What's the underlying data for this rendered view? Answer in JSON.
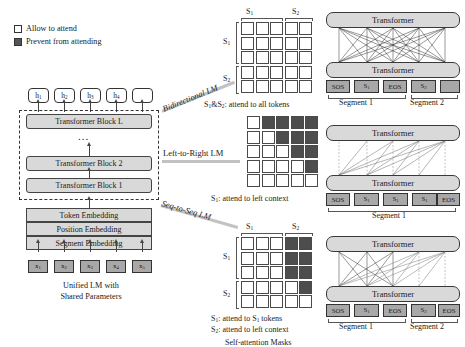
{
  "figure": {
    "kind": "unilm-pretraining-diagram",
    "legend": {
      "allow_label": "Allow to attend",
      "prevent_label": "Prevent from attending",
      "allow_color": "#ffffff",
      "prevent_color": "#4d4d4d"
    },
    "left_panel": {
      "hidden_states": [
        "h1",
        "h2",
        "h3",
        "h4",
        ""
      ],
      "blocks": [
        "Transformer Block L",
        "Transformer Block 2",
        "Transformer Block 1"
      ],
      "ellipsis": "...",
      "embeddings": [
        "Token Embedding",
        "Position Embedding",
        "Segment Embedding"
      ],
      "input_tokens": [
        "x1",
        "x2",
        "x3",
        "x4",
        "x5"
      ],
      "caption_line1": "Unified LM with",
      "caption_line2": "Shared Parameters"
    },
    "objectives": [
      {
        "name": "bidirectional",
        "label": "Bidirectional LM"
      },
      {
        "name": "left-to-right",
        "label": "Left-to-Right LM"
      },
      {
        "name": "seq-to-seq",
        "label": "Seq-to-Seq LM"
      }
    ],
    "masks": [
      {
        "name": "bidirectional-mask",
        "col_labels": [
          "S1",
          "S2"
        ],
        "row_labels": [
          "S1",
          "S2"
        ],
        "rows": [
          [
            "w",
            "w",
            "w",
            "w",
            "w"
          ],
          [
            "w",
            "w",
            "w",
            "w",
            "w"
          ],
          [
            "w",
            "w",
            "w",
            "w",
            "w"
          ],
          [
            "w",
            "w",
            "w",
            "w",
            "w"
          ],
          [
            "w",
            "w",
            "w",
            "w",
            "w"
          ]
        ],
        "captions": [
          "S1&S2: attend to all tokens"
        ]
      },
      {
        "name": "left-to-right-mask",
        "col_labels": [],
        "row_labels": [],
        "rows": [
          [
            "w",
            "d",
            "d",
            "d",
            "d"
          ],
          [
            "w",
            "w",
            "d",
            "d",
            "d"
          ],
          [
            "w",
            "w",
            "w",
            "d",
            "d"
          ],
          [
            "w",
            "w",
            "w",
            "w",
            "d"
          ],
          [
            "w",
            "w",
            "w",
            "w",
            "w"
          ]
        ],
        "captions": [
          "S1: attend to left context"
        ]
      },
      {
        "name": "seq-to-seq-mask",
        "col_labels": [
          "S1",
          "S2"
        ],
        "row_labels": [
          "S1",
          "S2"
        ],
        "rows": [
          [
            "w",
            "w",
            "w",
            "d",
            "d"
          ],
          [
            "w",
            "w",
            "w",
            "d",
            "d"
          ],
          [
            "w",
            "w",
            "w",
            "d",
            "d"
          ],
          [
            "w",
            "w",
            "w",
            "w",
            "d"
          ],
          [
            "w",
            "w",
            "w",
            "w",
            "w"
          ]
        ],
        "captions": [
          "S1: attend to S1 tokens",
          "S2: attend to left context"
        ]
      }
    ],
    "masks_caption": "Self-attention Masks",
    "right_panels": [
      {
        "name": "bidirectional-transformer-stack",
        "upper_label": "Transformer",
        "lower_label": "Transformer",
        "tokens": [
          "SOS",
          "S1",
          "EOS",
          "S2",
          ""
        ],
        "segments": [
          {
            "label": "Segment 1",
            "span": 3
          },
          {
            "label": "Segment 2",
            "span": 2
          }
        ],
        "attention": "full-bidirectional"
      },
      {
        "name": "left-to-right-transformer-stack",
        "upper_label": "Transformer",
        "lower_label": "Transformer",
        "tokens": [
          "SOS",
          "S1",
          "S1",
          "S1",
          "EOS"
        ],
        "segments": [
          {
            "label": "Segment 1",
            "span": 5
          }
        ],
        "attention": "causal-left-to-right"
      },
      {
        "name": "seq-to-seq-transformer-stack",
        "upper_label": "Transformer",
        "lower_label": "Transformer",
        "tokens": [
          "SOS",
          "S1",
          "EOS",
          "S2",
          "EOS"
        ],
        "segments": [
          {
            "label": "Segment 1",
            "span": 3
          },
          {
            "label": "Segment 2",
            "span": 2
          }
        ],
        "attention": "source-bidirectional-target-causal"
      }
    ]
  }
}
